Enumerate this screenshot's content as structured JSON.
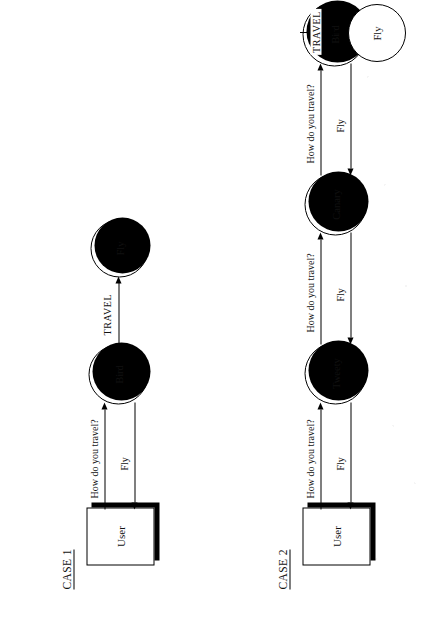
{
  "figure": {
    "type": "message-sequence-delegation-diagram",
    "orientation_note": "page scanned rotated 90 degrees counter-clockwise",
    "cases": [
      {
        "label": "CASE 1",
        "actor": {
          "name": "User"
        },
        "nodes": [
          {
            "id": "bird1",
            "label": "Bird"
          },
          {
            "id": "fly1",
            "label": "Fly"
          }
        ],
        "edges": [
          {
            "from": "User",
            "to": "Bird",
            "label": "How do you travel?",
            "direction": "right"
          },
          {
            "from": "Bird",
            "to": "User",
            "label": "Fly",
            "direction": "left"
          },
          {
            "from": "Bird",
            "to": "Fly",
            "label": "TRAVEL",
            "direction": "right"
          }
        ]
      },
      {
        "label": "CASE 2",
        "actor": {
          "name": "User"
        },
        "nodes": [
          {
            "id": "tweety",
            "label": "Tweety"
          },
          {
            "id": "canary",
            "label": "Canary"
          },
          {
            "id": "bird2",
            "label": "Bird"
          },
          {
            "id": "fly2",
            "label": "Fly"
          }
        ],
        "edges": [
          {
            "from": "User",
            "to": "Tweety",
            "label": "How do you travel?",
            "direction": "right"
          },
          {
            "from": "Tweety",
            "to": "User",
            "label": "Fly",
            "direction": "left"
          },
          {
            "from": "Tweety",
            "to": "Canary",
            "label": "How do you travel?",
            "direction": "right"
          },
          {
            "from": "Canary",
            "to": "Tweety",
            "label": "Fly",
            "direction": "left"
          },
          {
            "from": "Canary",
            "to": "Bird",
            "label": "How do you travel?",
            "direction": "right"
          },
          {
            "from": "Bird",
            "to": "Canary",
            "label": "Fly",
            "direction": "left"
          },
          {
            "from": "Bird",
            "to": "Fly",
            "label": "TRAVEL",
            "direction": "right"
          }
        ]
      }
    ]
  },
  "labels": {
    "case1": "CASE 1",
    "case2": "CASE 2",
    "user": "User",
    "bird": "Bird",
    "fly": "Fly",
    "tweety": "Tweety",
    "canary": "Canary",
    "how_do_you_travel": "How do you travel?",
    "fly_reply": "Fly",
    "travel": "TRAVEL"
  },
  "colors": {
    "ink": "#000000",
    "paper": "#ffffff"
  }
}
